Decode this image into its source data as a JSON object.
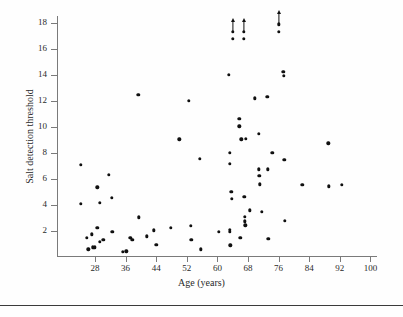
{
  "figure": {
    "xlabel": "Age (years)",
    "ylabel": "Salt detection threshold"
  },
  "chart_data": {
    "type": "scatter",
    "title": "",
    "xlabel": "Age (years)",
    "ylabel": "Salt detection threshold",
    "xlim": [
      22,
      102
    ],
    "ylim": [
      0,
      18.8
    ],
    "xticks": [
      28,
      36,
      44,
      52,
      60,
      68,
      76,
      84,
      92,
      100
    ],
    "yticks": [
      2,
      4,
      6,
      8,
      10,
      12,
      14,
      16,
      18
    ],
    "grid": false,
    "legend": null,
    "marker": "filled-circle",
    "marker_color": "#101010",
    "note": "Three points carry upward arrows indicating values exceeding the plotted scale",
    "points": [
      {
        "x": 24.3,
        "y": 7.1
      },
      {
        "x": 24.3,
        "y": 4.1
      },
      {
        "x": 25.8,
        "y": 1.5
      },
      {
        "x": 26.3,
        "y": 0.6
      },
      {
        "x": 27.2,
        "y": 1.75
      },
      {
        "x": 27.4,
        "y": 0.75
      },
      {
        "x": 27.7,
        "y": 0.7
      },
      {
        "x": 28.0,
        "y": 0.75
      },
      {
        "x": 28.6,
        "y": 5.35
      },
      {
        "x": 28.6,
        "y": 2.25
      },
      {
        "x": 29.2,
        "y": 4.15
      },
      {
        "x": 29.3,
        "y": 1.15
      },
      {
        "x": 30.2,
        "y": 1.3
      },
      {
        "x": 31.6,
        "y": 6.3
      },
      {
        "x": 32.4,
        "y": 4.55
      },
      {
        "x": 32.5,
        "y": 1.95
      },
      {
        "x": 35.2,
        "y": 0.4
      },
      {
        "x": 36.2,
        "y": 0.45
      },
      {
        "x": 37.2,
        "y": 1.5
      },
      {
        "x": 37.8,
        "y": 1.3
      },
      {
        "x": 39.3,
        "y": 12.5
      },
      {
        "x": 39.4,
        "y": 3.05
      },
      {
        "x": 41.6,
        "y": 1.6
      },
      {
        "x": 43.4,
        "y": 2.05
      },
      {
        "x": 44.0,
        "y": 0.95
      },
      {
        "x": 47.8,
        "y": 2.25
      },
      {
        "x": 50.0,
        "y": 9.05
      },
      {
        "x": 52.6,
        "y": 12.0
      },
      {
        "x": 53.0,
        "y": 2.4
      },
      {
        "x": 53.2,
        "y": 1.3
      },
      {
        "x": 55.4,
        "y": 7.55
      },
      {
        "x": 55.6,
        "y": 0.6
      },
      {
        "x": 60.3,
        "y": 1.95
      },
      {
        "x": 63.0,
        "y": 14.0
      },
      {
        "x": 63.2,
        "y": 8.0
      },
      {
        "x": 63.2,
        "y": 7.15
      },
      {
        "x": 63.3,
        "y": 2.1
      },
      {
        "x": 63.3,
        "y": 1.95
      },
      {
        "x": 63.4,
        "y": 0.9
      },
      {
        "x": 63.6,
        "y": 5.0
      },
      {
        "x": 63.7,
        "y": 4.5
      },
      {
        "x": 64.0,
        "y": 17.3
      },
      {
        "x": 64.0,
        "y": 16.8
      },
      {
        "x": 65.7,
        "y": 10.65
      },
      {
        "x": 65.7,
        "y": 10.05
      },
      {
        "x": 66.0,
        "y": 1.5
      },
      {
        "x": 66.2,
        "y": 9.05
      },
      {
        "x": 66.9,
        "y": 17.3
      },
      {
        "x": 66.9,
        "y": 16.8
      },
      {
        "x": 67.0,
        "y": 4.65
      },
      {
        "x": 67.1,
        "y": 3.1
      },
      {
        "x": 67.2,
        "y": 2.75
      },
      {
        "x": 67.3,
        "y": 2.45
      },
      {
        "x": 67.5,
        "y": 9.1
      },
      {
        "x": 68.5,
        "y": 3.6
      },
      {
        "x": 69.7,
        "y": 12.2
      },
      {
        "x": 70.8,
        "y": 9.5
      },
      {
        "x": 70.9,
        "y": 6.75
      },
      {
        "x": 71.0,
        "y": 6.25
      },
      {
        "x": 71.1,
        "y": 5.6
      },
      {
        "x": 71.6,
        "y": 3.5
      },
      {
        "x": 73.0,
        "y": 12.3
      },
      {
        "x": 73.1,
        "y": 6.75
      },
      {
        "x": 73.3,
        "y": 1.4
      },
      {
        "x": 74.4,
        "y": 8.0
      },
      {
        "x": 76.0,
        "y": 17.9
      },
      {
        "x": 76.1,
        "y": 17.3
      },
      {
        "x": 77.2,
        "y": 14.25
      },
      {
        "x": 77.4,
        "y": 13.95
      },
      {
        "x": 77.5,
        "y": 7.5
      },
      {
        "x": 77.6,
        "y": 2.8
      },
      {
        "x": 82.2,
        "y": 5.55
      },
      {
        "x": 89.0,
        "y": 8.75
      },
      {
        "x": 89.1,
        "y": 5.45
      },
      {
        "x": 92.5,
        "y": 5.55
      }
    ],
    "arrow_points": [
      {
        "x": 64.0,
        "y": 17.3
      },
      {
        "x": 66.9,
        "y": 17.3
      },
      {
        "x": 76.0,
        "y": 17.9
      }
    ]
  }
}
